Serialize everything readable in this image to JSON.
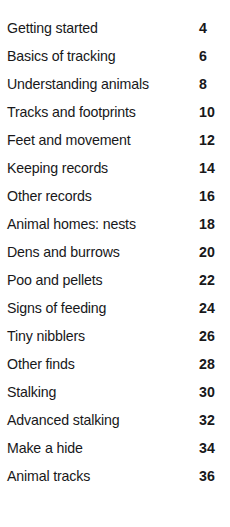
{
  "heading": {
    "text": "Contents",
    "note": "clipped faint heading at top edge"
  },
  "toc": {
    "entries": [
      {
        "title": "Getting started",
        "page": "4"
      },
      {
        "title": "Basics of tracking",
        "page": "6"
      },
      {
        "title": "Understanding animals",
        "page": "8"
      },
      {
        "title": "Tracks and footprints",
        "page": "10"
      },
      {
        "title": "Feet and movement",
        "page": "12"
      },
      {
        "title": "Keeping records",
        "page": "14"
      },
      {
        "title": "Other records",
        "page": "16"
      },
      {
        "title": "Animal homes: nests",
        "page": "18"
      },
      {
        "title": "Dens and burrows",
        "page": "20"
      },
      {
        "title": "Poo and pellets",
        "page": "22"
      },
      {
        "title": "Signs of feeding",
        "page": "24"
      },
      {
        "title": "Tiny nibblers",
        "page": "26"
      },
      {
        "title": "Other finds",
        "page": "28"
      },
      {
        "title": "Stalking",
        "page": "30"
      },
      {
        "title": "Advanced stalking",
        "page": "32"
      },
      {
        "title": "Make a hide",
        "page": "34"
      },
      {
        "title": "Animal tracks",
        "page": "36"
      }
    ]
  },
  "colors": {
    "background": "#ffffff",
    "text": "#18181a",
    "heading_faint": "#f4f4f6"
  }
}
